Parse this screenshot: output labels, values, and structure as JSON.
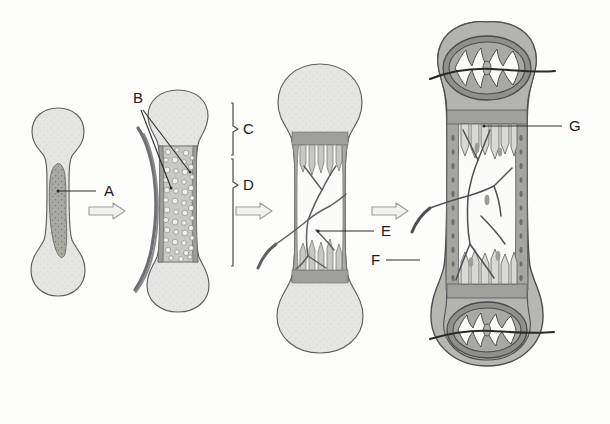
{
  "figure": {
    "background_color": "#fdfdfc",
    "ink_color": "#3a3a3a",
    "stage_count": 4
  },
  "labels": [
    {
      "id": "A",
      "text": "A",
      "x": 104,
      "y": 196,
      "leader_from_x": 96,
      "leader_from_y": 191,
      "leader_to_x": 58,
      "leader_to_y": 191,
      "refers_to": "hyaline-cartilage-core-primary-center"
    },
    {
      "id": "B",
      "text": "B",
      "x": 137,
      "y": 103,
      "refers_to": "hypertrophied-chondrocytes"
    },
    {
      "id": "C",
      "text": "C",
      "x": 243,
      "y": 130,
      "refers_to": "epiphysis-bracket"
    },
    {
      "id": "D",
      "text": "D",
      "x": 243,
      "y": 185,
      "refers_to": "diaphysis-bracket"
    },
    {
      "id": "E",
      "text": "E",
      "x": 381,
      "y": 236,
      "leader_from_x": 374,
      "leader_from_y": 231,
      "leader_to_x": 318,
      "leader_to_y": 231,
      "refers_to": "medullary-cavity-blood-vessels"
    },
    {
      "id": "F",
      "text": "F",
      "x": 377,
      "y": 265,
      "leader_from_x": 386,
      "leader_from_y": 260,
      "leader_to_x": 420,
      "leader_to_y": 260,
      "refers_to": "periosteal-blood-vessel"
    },
    {
      "id": "G",
      "text": "G",
      "x": 569,
      "y": 131,
      "leader_from_x": 562,
      "leader_from_y": 126,
      "leader_to_x": 484,
      "leader_to_y": 126,
      "refers_to": "epiphyseal-plate"
    }
  ],
  "brackets": [
    {
      "id": "C",
      "label": "C",
      "x": 231,
      "y_top": 103,
      "y_bottom": 155,
      "tip_x": 237
    },
    {
      "id": "D",
      "label": "D",
      "x": 231,
      "y_top": 159,
      "y_bottom": 266,
      "tip_x": 237
    }
  ],
  "arrows": [
    {
      "id": "arrow-1",
      "x": 89,
      "y": 203,
      "width": 36,
      "height": 16,
      "direction": "right"
    },
    {
      "id": "arrow-2",
      "x": 236,
      "y": 203,
      "width": 36,
      "height": 16,
      "direction": "right"
    },
    {
      "id": "arrow-3",
      "x": 372,
      "y": 203,
      "width": 36,
      "height": 16,
      "direction": "right"
    }
  ],
  "stages": [
    {
      "id": "stage-1",
      "name": "cartilage-model",
      "center_x": 58,
      "description": "Hyaline cartilage model with darker primary ossification core"
    },
    {
      "id": "stage-2",
      "name": "primary-ossification-center",
      "center_x": 178,
      "description": "Bone collar and hypertrophied chondrocytes in diaphysis with periosteal vessel"
    },
    {
      "id": "stage-3",
      "name": "medullary-cavity-formation",
      "center_x": 320,
      "description": "Medullary cavity with invading blood vessels and trabeculae"
    },
    {
      "id": "stage-4",
      "name": "secondary-ossification-centers",
      "center_x": 487,
      "description": "Secondary ossification centers in both epiphyses with epiphyseal plates"
    }
  ],
  "colors": {
    "cartilage_light": "#e3e4e1",
    "cartilage_mid": "#cfd0cc",
    "bone_gray": "#b4b5b1",
    "dark_gray": "#9a9b96",
    "core_dark": "#a8a9a3",
    "outline": "#55565a",
    "vessel": "#6a6b6e",
    "marrow_white": "#f7f7f6"
  }
}
